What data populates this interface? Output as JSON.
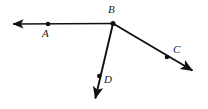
{
  "figure": {
    "type": "geometry-diagram",
    "width": 208,
    "height": 109,
    "background_color": "#ffffff",
    "stroke_color": "#111111",
    "labels": {
      "a": "A",
      "b": "B",
      "c": "C",
      "d": "D"
    },
    "points": [
      {
        "name": "A",
        "label": "A",
        "x": 48,
        "y": 24,
        "kind": "dot"
      },
      {
        "name": "B",
        "label": "B",
        "x": 113,
        "y": 23,
        "kind": "vertex"
      },
      {
        "name": "C",
        "label": "C",
        "x": 167,
        "y": 57,
        "kind": "dot"
      },
      {
        "name": "D",
        "label": "D",
        "x": 99,
        "y": 76,
        "kind": "dot"
      }
    ],
    "rays": [
      {
        "name": "ray-BA",
        "from": [
          113,
          23
        ],
        "to": [
          9,
          24
        ],
        "arrow_at": "end"
      },
      {
        "name": "ray-BC",
        "from": [
          113,
          23
        ],
        "to": [
          196,
          73
        ],
        "arrow_at": "end"
      },
      {
        "name": "ray-BD",
        "from": [
          113,
          23
        ],
        "to": [
          94,
          103
        ],
        "arrow_at": "end"
      }
    ]
  }
}
